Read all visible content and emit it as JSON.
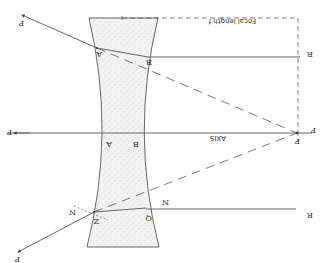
{
  "diagram": {
    "orientation": "rotated 180 degrees",
    "colors": {
      "line": "#555555",
      "lens_fill": "#f1f1f1",
      "lens_stipple": "#b5b5b5",
      "background": "#ffffff"
    },
    "labels": {
      "axis": "AXIS",
      "focal_length": "Focal length f",
      "focus": "F",
      "focus_outer": "F",
      "upper_ray_in": "P",
      "upper_entry": "A",
      "upper_exit": "B",
      "upper_ray_out": "R",
      "axis_left": "P",
      "axis_lens_left": "A",
      "axis_lens_right": "B",
      "lower_ray_in": "P",
      "lower_entry": "Z",
      "lower_exit": "Q",
      "lower_ray_out": "R",
      "normal_left": "N",
      "normal_right": "N"
    }
  }
}
